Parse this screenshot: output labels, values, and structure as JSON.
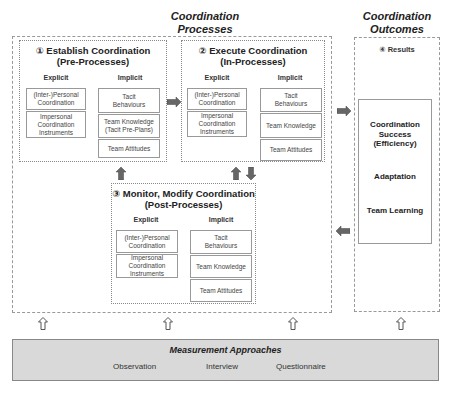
{
  "headings": {
    "processes_line1": "Coordination",
    "processes_line2": "Processes",
    "outcomes_line1": "Coordination",
    "outcomes_line2": "Outcomes"
  },
  "stages": [
    {
      "number": "①",
      "title_line1": "① Establish Coordination",
      "title_line2": "(Pre-Processes)",
      "explicit_label": "Explicit",
      "implicit_label": "Implicit",
      "explicit": [
        [
          "(Inter-)Personal",
          "Coordination"
        ],
        [
          "Impersonal",
          "Coordination",
          "Instruments"
        ]
      ],
      "implicit": [
        [
          "Tacit",
          "Behaviours"
        ],
        [
          "Team Knowledge",
          "(Tacit Pre-Plans)"
        ],
        [
          "Team Attitudes"
        ]
      ]
    },
    {
      "number": "②",
      "title_line1": "② Execute Coordination",
      "title_line2": "(In-Processes)",
      "explicit_label": "Explicit",
      "implicit_label": "Implicit",
      "explicit": [
        [
          "(Inter-)Personal",
          "Coordination"
        ],
        [
          "Impersonal",
          "Coordination",
          "Instruments"
        ]
      ],
      "implicit": [
        [
          "Tacit",
          "Behaviours"
        ],
        [
          "Team Knowledge"
        ],
        [
          "Team Attitudes"
        ]
      ]
    },
    {
      "number": "③",
      "title_line1": "③ Monitor, Modify Coordination",
      "title_line2": "(Post-Processes)",
      "explicit_label": "Explicit",
      "implicit_label": "Implicit",
      "explicit": [
        [
          "(Inter-)Personal",
          "Coordination"
        ],
        [
          "Impersonal",
          "Coordination",
          "Instruments"
        ]
      ],
      "implicit": [
        [
          "Tacit",
          "Behaviours"
        ],
        [
          "Team Knowledge"
        ],
        [
          "Team Attitudes"
        ]
      ]
    }
  ],
  "results": {
    "title": "④ Results",
    "items": [
      [
        "Coordination",
        "Success",
        "(Efficiency)"
      ],
      [
        "Adaptation"
      ],
      [
        "Team Learning"
      ]
    ]
  },
  "measurement": {
    "title": "Measurement Approaches",
    "items": [
      "Observation",
      "Interview",
      "Questionnaire"
    ]
  },
  "colors": {
    "arrow_fill": "#666666",
    "measurement_bg": "#d9d9d9",
    "border": "#999999"
  }
}
